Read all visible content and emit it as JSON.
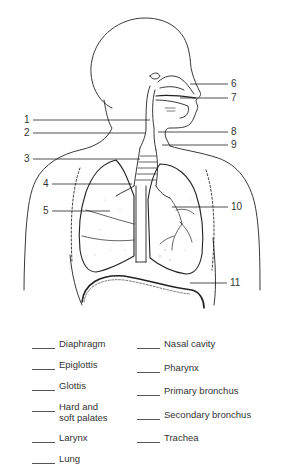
{
  "diagram": {
    "callouts": [
      {
        "num": "1",
        "x": 24,
        "y": 116
      },
      {
        "num": "2",
        "x": 24,
        "y": 129
      },
      {
        "num": "3",
        "x": 24,
        "y": 154
      },
      {
        "num": "4",
        "x": 43,
        "y": 179
      },
      {
        "num": "5",
        "x": 43,
        "y": 206
      },
      {
        "num": "6",
        "x": 231,
        "y": 79
      },
      {
        "num": "7",
        "x": 231,
        "y": 93
      },
      {
        "num": "8",
        "x": 231,
        "y": 127
      },
      {
        "num": "9",
        "x": 231,
        "y": 140
      },
      {
        "num": "10",
        "x": 231,
        "y": 202
      },
      {
        "num": "11",
        "x": 230,
        "y": 278
      }
    ]
  },
  "answer_key": {
    "left_column": [
      {
        "label": "Diaphragm"
      },
      {
        "label": "Epiglottis"
      },
      {
        "label": "Glottis"
      },
      {
        "label": "Hard and soft palates",
        "line1": "Hard and",
        "line2": "soft palates"
      },
      {
        "label": "Larynx"
      },
      {
        "label": "Lung"
      }
    ],
    "right_column": [
      {
        "label": "Nasal cavity"
      },
      {
        "label": "Pharynx"
      },
      {
        "label": "Primary bronchus"
      },
      {
        "label": "Secondary bronchus"
      },
      {
        "label": "Trachea"
      }
    ],
    "blank": "____"
  }
}
